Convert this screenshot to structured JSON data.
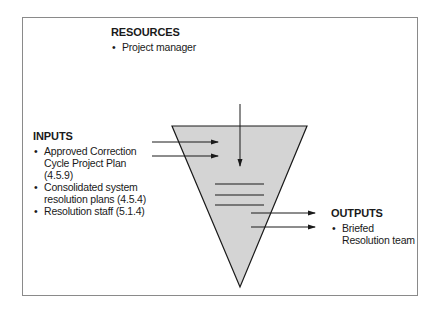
{
  "resources": {
    "title": "RESOURCES",
    "items": [
      "Project manager"
    ]
  },
  "inputs": {
    "title": "INPUTS",
    "items": [
      "Approved Correction Cycle Project Plan (4.5.9)",
      "Consolidated system resolution plans (4.5.4)",
      "Resolution staff (5.1.4)"
    ]
  },
  "outputs": {
    "title": "OUTPUTS",
    "items": [
      "Briefed Resolution team"
    ]
  },
  "colors": {
    "funnel_fill": "#d4d4d4",
    "stroke": "#1a1a1a",
    "frame_border": "#8a8a8a"
  }
}
